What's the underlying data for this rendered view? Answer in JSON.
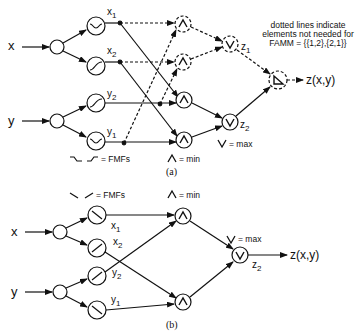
{
  "diagram_a": {
    "inputs": {
      "x": "x",
      "y": "y"
    },
    "fmf_labels": {
      "x1": "x",
      "x1_sub": "1",
      "x2": "x",
      "x2_sub": "2",
      "y2": "y",
      "y2_sub": "2",
      "y1": "y",
      "y1_sub": "1"
    },
    "z1": "z",
    "z1_sub": "1",
    "z2": "z",
    "z2_sub": "2",
    "output": "z(x,y)",
    "legend_fmf": "= FMFs",
    "legend_min": "= min",
    "legend_max": "= max",
    "note_line1": "dotted lines indicate",
    "note_line2": "elements not needed for",
    "note_line3": "FAMM = {{1,2},{2,1}}",
    "caption": "(a)"
  },
  "diagram_b": {
    "inputs": {
      "x": "x",
      "y": "y"
    },
    "fmf_labels": {
      "x1": "x",
      "x1_sub": "1",
      "x2": "x",
      "x2_sub": "2",
      "y2": "y",
      "y2_sub": "2",
      "y1": "y",
      "y1_sub": "1"
    },
    "z2": "z",
    "z2_sub": "2",
    "output": "z(x,y)",
    "legend_fmf": "= FMFs",
    "legend_min": "= min",
    "legend_max": "= max",
    "caption": "(b)"
  }
}
